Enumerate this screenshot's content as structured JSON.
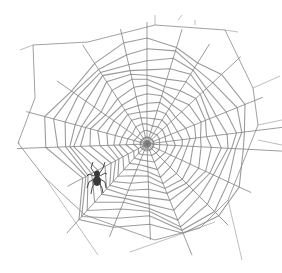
{
  "image": {
    "subject": "spider web illustration",
    "description": "Pencil-style drawing of an orb spider web with a small spider on the lower-left part",
    "colors": {
      "background": "#ffffff",
      "thread": "#8a8a8a",
      "thread_dark": "#666666",
      "spider": "#3a3a3a"
    },
    "web": {
      "center": [
        147,
        144
      ],
      "spokes": [
        {
          "angle": -90,
          "length": 122
        },
        {
          "angle": -73,
          "length": 120
        },
        {
          "angle": -58,
          "length": 118
        },
        {
          "angle": -43,
          "length": 128
        },
        {
          "angle": -22,
          "length": 125
        },
        {
          "angle": -7,
          "length": 136
        },
        {
          "angle": 3,
          "length": 135
        },
        {
          "angle": 25,
          "length": 115
        },
        {
          "angle": 45,
          "length": 115
        },
        {
          "angle": 68,
          "length": 120
        },
        {
          "angle": 88,
          "length": 96
        },
        {
          "angle": 112,
          "length": 100
        },
        {
          "angle": 132,
          "length": 120
        },
        {
          "angle": 152,
          "length": 90
        },
        {
          "angle": 178,
          "length": 130
        },
        {
          "angle": 195,
          "length": 125
        },
        {
          "angle": 215,
          "length": 110
        },
        {
          "angle": 237,
          "length": 118
        },
        {
          "angle": 257,
          "length": 118
        }
      ],
      "rings": 14,
      "frame": [
        [
          33,
          45
        ],
        [
          88,
          42
        ],
        [
          155,
          25
        ],
        [
          225,
          30
        ],
        [
          253,
          88
        ],
        [
          258,
          125
        ],
        [
          228,
          200
        ],
        [
          200,
          228
        ],
        [
          155,
          240
        ],
        [
          85,
          215
        ],
        [
          45,
          178
        ],
        [
          18,
          143
        ],
        [
          35,
          98
        ]
      ],
      "anchor_lines": [
        [
          [
            33,
            45
          ],
          [
            20,
            50
          ]
        ],
        [
          [
            155,
            25
          ],
          [
            155,
            15
          ]
        ],
        [
          [
            178,
            20
          ],
          [
            182,
            15
          ]
        ],
        [
          [
            195,
            25
          ],
          [
            195,
            20
          ]
        ],
        [
          [
            225,
            30
          ],
          [
            238,
            32
          ]
        ],
        [
          [
            253,
            88
          ],
          [
            280,
            76
          ]
        ],
        [
          [
            258,
            125
          ],
          [
            282,
            120
          ]
        ],
        [
          [
            258,
            140
          ],
          [
            282,
            145
          ]
        ],
        [
          [
            228,
            200
          ],
          [
            242,
            260
          ]
        ],
        [
          [
            45,
            178
          ],
          [
            98,
            255
          ]
        ],
        [
          [
            18,
            143
          ],
          [
            20,
            143
          ]
        ],
        [
          [
            130,
            252
          ],
          [
            215,
            222
          ]
        ]
      ]
    },
    "spider": {
      "position": [
        97,
        178
      ],
      "size": 14
    }
  }
}
